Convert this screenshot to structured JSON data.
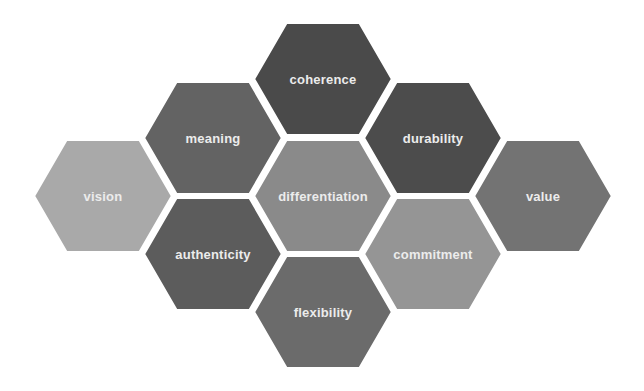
{
  "diagram": {
    "type": "hexagon-cluster",
    "hex": {
      "half_width": 70,
      "half_height": 57,
      "shoulder": 33,
      "gap_color": "#ffffff",
      "text_color": "#ececec"
    },
    "cells": [
      {
        "id": "coherence",
        "label": "coherence",
        "cx": 323,
        "cy": 79,
        "color": "#4a4a4a"
      },
      {
        "id": "meaning",
        "label": "meaning",
        "cx": 213,
        "cy": 138,
        "color": "#636363"
      },
      {
        "id": "durability",
        "label": "durability",
        "cx": 433,
        "cy": 138,
        "color": "#4c4c4c"
      },
      {
        "id": "vision",
        "label": "vision",
        "cx": 103,
        "cy": 196,
        "color": "#a9a9a9"
      },
      {
        "id": "differentiation",
        "label": "differentiation",
        "cx": 323,
        "cy": 196,
        "color": "#8a8a8a"
      },
      {
        "id": "value",
        "label": "value",
        "cx": 543,
        "cy": 196,
        "color": "#737373"
      },
      {
        "id": "authenticity",
        "label": "authenticity",
        "cx": 213,
        "cy": 254,
        "color": "#5c5c5c"
      },
      {
        "id": "commitment",
        "label": "commitment",
        "cx": 433,
        "cy": 254,
        "color": "#959595"
      },
      {
        "id": "flexibility",
        "label": "flexibility",
        "cx": 323,
        "cy": 312,
        "color": "#6b6b6b"
      }
    ]
  }
}
